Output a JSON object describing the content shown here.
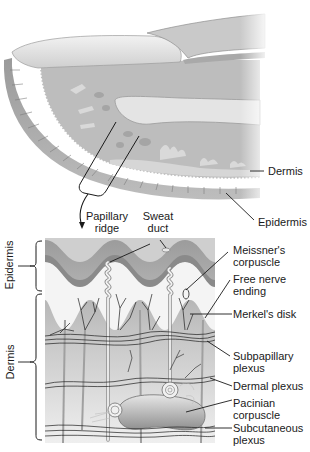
{
  "figure": {
    "top_panel": {
      "labels": {
        "dermis": "Dermis",
        "epidermis": "Epidermis"
      }
    },
    "callout": {
      "papillary_ridge": [
        "Papillary",
        "ridge"
      ],
      "sweat_duct": [
        "Sweat",
        "duct"
      ]
    },
    "bottom_panel": {
      "side_labels": {
        "epidermis": "Epidermis",
        "dermis": "Dermis"
      },
      "right_labels": [
        {
          "id": "meissner",
          "lines": [
            "Meissner's",
            "corpuscle"
          ]
        },
        {
          "id": "free-nerve",
          "lines": [
            "Free nerve",
            "ending"
          ]
        },
        {
          "id": "merkel",
          "lines": [
            "Merkel's disk"
          ]
        },
        {
          "id": "subpapillary",
          "lines": [
            "Subpapillary",
            "plexus"
          ]
        },
        {
          "id": "dermal",
          "lines": [
            "Dermal plexus"
          ]
        },
        {
          "id": "pacinian",
          "lines": [
            "Pacinian",
            "corpuscle"
          ]
        },
        {
          "id": "subcutaneous",
          "lines": [
            "Subcutaneous",
            "plexus"
          ]
        }
      ]
    },
    "colors": {
      "background": "#ffffff",
      "skin_light": "#d9d9d9",
      "skin_mid": "#b5b5b5",
      "skin_dark": "#8e8e8e",
      "line": "#1a1a1a"
    }
  }
}
